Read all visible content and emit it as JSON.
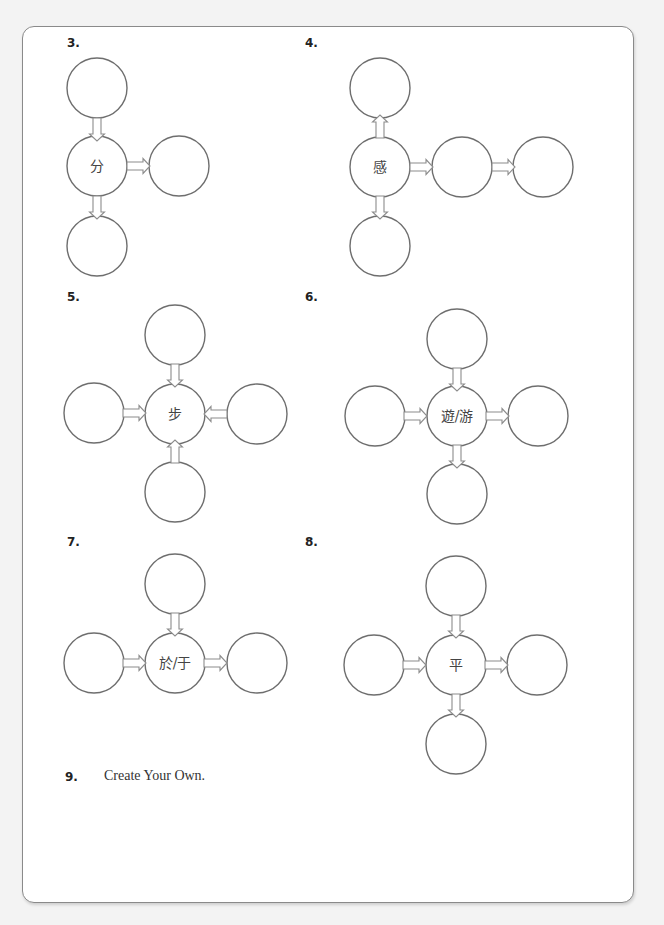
{
  "colors": {
    "background": "#f3f3f3",
    "card": "#ffffff",
    "circle_stroke": "#6e6e6e",
    "arrow_stroke": "#8c8c8c"
  },
  "exercises": [
    {
      "number": "3.",
      "center_char": "分"
    },
    {
      "number": "4.",
      "center_char": "感"
    },
    {
      "number": "5.",
      "center_char": "步"
    },
    {
      "number": "6.",
      "center_char": "遊/游"
    },
    {
      "number": "7.",
      "center_char": "於/于"
    },
    {
      "number": "8.",
      "center_char": "平"
    }
  ],
  "create_own": {
    "number": "9.",
    "label": "Create Your Own."
  }
}
